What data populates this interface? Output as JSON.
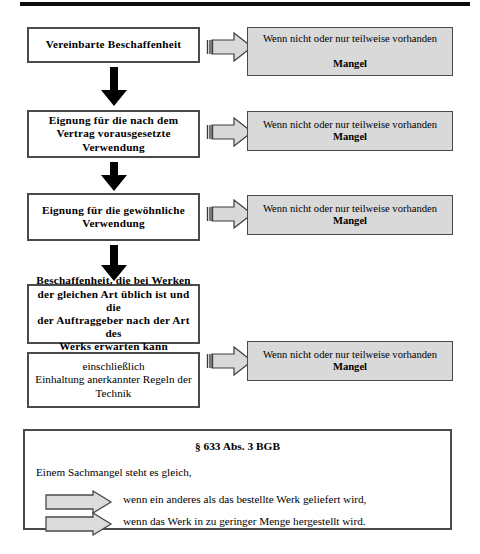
{
  "document": {
    "language": "de",
    "top_rule": true
  },
  "flow": {
    "steps": [
      {
        "id": "step-1",
        "label": "Vereinbarte Beschaffenheit",
        "bold": true
      },
      {
        "id": "step-2",
        "label": "Eignung für  die nach dem\nVertrag vorausgesetzte\nVerwendung",
        "bold": true
      },
      {
        "id": "step-3",
        "label": "Eignung für die gewöhnliche\nVerwendung",
        "bold": true
      },
      {
        "id": "step-4",
        "label": "Beschaffenheit, die bei Werken\nder gleichen Art üblich ist und die\nder Auftraggeber nach der Art des\nWerks erwarten kann",
        "bold": true
      },
      {
        "id": "step-5",
        "label": "einschließlich\nEinhaltung anerkannter Regeln der\nTechnik",
        "bold": false
      }
    ],
    "consequences": [
      {
        "id": "consequence-1",
        "condition": "Wenn nicht oder nur teilweise vorhanden",
        "result": "Mangel"
      },
      {
        "id": "consequence-2",
        "condition": "Wenn nicht oder nur teilweise vorhanden",
        "result": "Mangel"
      },
      {
        "id": "consequence-3",
        "condition": "Wenn nicht oder nur teilweise vorhanden",
        "result": "Mangel"
      },
      {
        "id": "consequence-4",
        "condition": "Wenn nicht oder nur teilweise vorhanden",
        "result": "Mangel"
      }
    ]
  },
  "statute": {
    "title": "§ 633 Abs. 3 BGB",
    "intro": "Einem Sachmangel steht es gleich,",
    "items": [
      "wenn ein anderes als das bestellte Werk geliefert wird,",
      "wenn das Werk in zu geringer Menge hergestellt wird."
    ]
  },
  "icons": {
    "flow_arrow": "down-arrow-icon",
    "connector_arrow": "right-block-arrow-icon",
    "bullet_arrow": "right-block-arrow-icon"
  },
  "colors": {
    "box_border": "#4a4a4a",
    "box_fill": "#ffffff",
    "gray_fill": "#d9d9d9",
    "arrow_fill": "#d9d9d9",
    "flow_arrow_fill": "#000000",
    "rule": "#0d0d0d",
    "text": "#000000"
  }
}
